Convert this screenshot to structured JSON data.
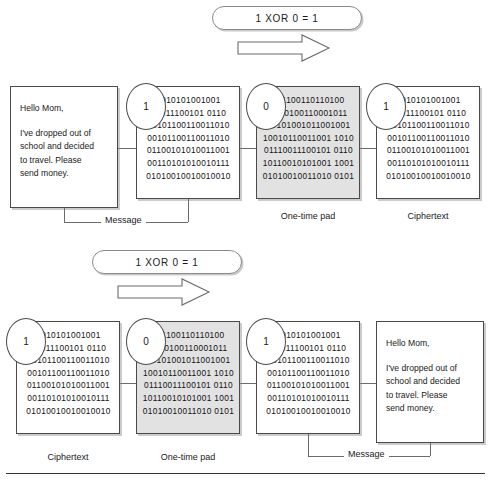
{
  "diagram": {
    "banner_top": {
      "text": "1 XOR 0 = 1"
    },
    "banner_bottom": {
      "text": "1 XOR 0 = 1"
    },
    "arrow_icon": "right-arrow-icon",
    "message_text": {
      "line1": "Hello Mom,",
      "line2": "I've dropped out of",
      "line3": "school and decided",
      "line4": "to travel. Please",
      "line5": "send money."
    },
    "bit_bubbles": {
      "top_message": "1",
      "top_pad": "0",
      "top_cipher": "1",
      "bottom_cipher": "1",
      "bottom_pad": "0",
      "bottom_message": "1"
    },
    "binary_blocks": {
      "plaintext_bits": [
        "1010101001001",
        "10011100101 0110",
        "00101100110011010",
        "00101100110011010",
        "01100101010011001",
        "00110101010010111",
        "01010010010010010"
      ],
      "pad_bits": [
        "011100110110100",
        "1010100110001011",
        "10101001011001001",
        "10010110011001 1010",
        "01110011100101 0110",
        "10110010101001 1001",
        "01010010011010 0101"
      ],
      "cipher_bits": [
        "1010101001001",
        "10011100101 0110",
        "00101100110011010",
        "00101100110011010",
        "01100101010011001",
        "00110101010010111",
        "01010010010010010"
      ]
    },
    "labels": {
      "top_message": "Message",
      "top_pad": "One-time pad",
      "top_cipher": "Ciphertext",
      "bottom_cipher": "Ciphertext",
      "bottom_pad": "One-time pad",
      "bottom_message": "Message"
    }
  },
  "colors": {
    "stroke": "#4a4a4a",
    "pad_fill": "#e2e2e2",
    "connector": "#6b6b6b",
    "rule": "#333333"
  }
}
